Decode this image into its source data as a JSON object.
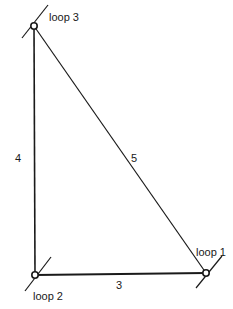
{
  "diagram": {
    "type": "graph",
    "nodes": [
      {
        "id": "loop1",
        "label": "loop 1",
        "x": 206,
        "y": 273
      },
      {
        "id": "loop2",
        "label": "loop 2",
        "x": 35,
        "y": 275
      },
      {
        "id": "loop3",
        "label": "loop 3",
        "x": 34,
        "y": 26
      }
    ],
    "edges": [
      {
        "from": "loop2",
        "to": "loop1",
        "label": "3"
      },
      {
        "from": "loop2",
        "to": "loop3",
        "label": "4"
      },
      {
        "from": "loop3",
        "to": "loop1",
        "label": "5"
      }
    ],
    "colors": {
      "line": "#1a1a1a",
      "background": "#ffffff"
    }
  }
}
